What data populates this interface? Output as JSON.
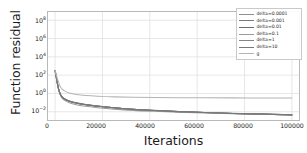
{
  "chart_data": {
    "type": "line",
    "title": "",
    "xlabel": "Iterations",
    "ylabel": "Function residual",
    "xscale": "linear",
    "yscale": "log",
    "xlim": [
      -3000,
      103000
    ],
    "ylim_exponent": [
      -2.9,
      8.9
    ],
    "grid": true,
    "legend_position": "upper right",
    "background": "#ffffff",
    "xticks": [
      "0",
      "20000",
      "40000",
      "60000",
      "80000",
      "100000"
    ],
    "xtick_values": [
      0,
      20000,
      40000,
      60000,
      80000,
      100000
    ],
    "ytick_exponents": [
      -2,
      0,
      2,
      4,
      6,
      8
    ],
    "yticks": [
      "10-2",
      "100",
      "102",
      "104",
      "106",
      "108"
    ],
    "x": [
      0,
      500,
      1000,
      1500,
      2000,
      2500,
      3000,
      4000,
      6000,
      9000,
      13000,
      18000,
      25000,
      33000,
      42000,
      52000,
      63000,
      75000,
      88000,
      100000
    ],
    "series": [
      {
        "name": "delta=0.0001",
        "color": "#8f8f8f",
        "values": [
          320.0,
          60.0,
          12.0,
          3.0,
          1.2,
          0.62,
          0.42,
          0.26,
          0.15,
          0.094,
          0.062,
          0.043,
          0.028,
          0.019,
          0.0142,
          0.0108,
          0.0085,
          0.0068,
          0.0056,
          0.0047
        ]
      },
      {
        "name": "delta=0.001",
        "color": "#7a7a7a",
        "values": [
          318.0,
          58.0,
          11.5,
          2.9,
          1.15,
          0.6,
          0.41,
          0.255,
          0.147,
          0.092,
          0.06,
          0.042,
          0.0275,
          0.0186,
          0.0139,
          0.0106,
          0.0083,
          0.0066,
          0.0055,
          0.0046
        ]
      },
      {
        "name": "delta=0.01",
        "color": "#6d6d6d",
        "values": [
          315.0,
          57.0,
          11.2,
          2.85,
          1.12,
          0.59,
          0.4,
          0.25,
          0.145,
          0.09,
          0.059,
          0.041,
          0.027,
          0.0183,
          0.0137,
          0.0104,
          0.0082,
          0.0065,
          0.0054,
          0.0045
        ]
      },
      {
        "name": "delta=0.1",
        "color": "#9b9b9b",
        "values": [
          300.0,
          52.0,
          10.0,
          2.4,
          0.95,
          0.46,
          0.3,
          0.175,
          0.098,
          0.06,
          0.039,
          0.028,
          0.0195,
          0.0142,
          0.0112,
          0.009,
          0.0074,
          0.0062,
          0.0053,
          0.0045
        ]
      },
      {
        "name": "delta=1",
        "color": "#858585",
        "values": [
          310.0,
          56.0,
          11.0,
          2.7,
          1.05,
          0.55,
          0.38,
          0.235,
          0.138,
          0.087,
          0.057,
          0.04,
          0.0265,
          0.018,
          0.0135,
          0.0103,
          0.0081,
          0.0065,
          0.0054,
          0.0045
        ]
      },
      {
        "name": "delta=10",
        "color": "#787878",
        "values": [
          312.0,
          57.0,
          11.3,
          2.8,
          1.1,
          0.57,
          0.39,
          0.245,
          0.142,
          0.089,
          0.058,
          0.0405,
          0.027,
          0.0182,
          0.0136,
          0.0104,
          0.0082,
          0.0066,
          0.0055,
          0.0046
        ]
      },
      {
        "name": "g",
        "color": "#b4b4b4",
        "values": [
          330.0,
          110.0,
          40.0,
          16.0,
          7.0,
          4.2,
          3.0,
          1.9,
          1.15,
          0.78,
          0.6,
          0.5,
          0.425,
          0.385,
          0.36,
          0.345,
          0.335,
          0.328,
          0.323,
          0.32
        ]
      }
    ]
  },
  "axes": {
    "ylabel": "Function residual",
    "xlabel": "Iterations"
  }
}
